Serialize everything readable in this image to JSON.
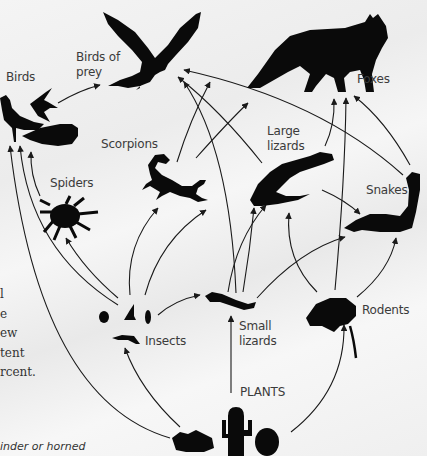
{
  "diagram": {
    "colors": {
      "silhouette": "#0a0a0a",
      "arrow": "#1a1a1a",
      "label": "#3b3b3b"
    },
    "nodes": [
      {
        "id": "birds",
        "label": "Birds"
      },
      {
        "id": "birds_of_prey",
        "label": "Birds of prey",
        "lines": [
          "Birds of",
          "prey"
        ]
      },
      {
        "id": "foxes",
        "label": "Foxes"
      },
      {
        "id": "scorpions",
        "label": "Scorpions"
      },
      {
        "id": "large_lizards",
        "label": "Large lizards",
        "lines": [
          "Large",
          "lizards"
        ]
      },
      {
        "id": "spiders",
        "label": "Spiders"
      },
      {
        "id": "snakes",
        "label": "Snakes"
      },
      {
        "id": "insects",
        "label": "Insects"
      },
      {
        "id": "small_lizards",
        "label": "Small lizards",
        "lines": [
          "Small",
          "lizards"
        ]
      },
      {
        "id": "rodents",
        "label": "Rodents"
      },
      {
        "id": "plants",
        "label": "PLANTS"
      }
    ],
    "edges": [
      {
        "from": "birds",
        "to": "birds_of_prey"
      },
      {
        "from": "scorpions",
        "to": "birds_of_prey"
      },
      {
        "from": "snakes",
        "to": "birds_of_prey"
      },
      {
        "from": "large_lizards",
        "to": "birds_of_prey"
      },
      {
        "from": "small_lizards",
        "to": "birds_of_prey"
      },
      {
        "from": "scorpions",
        "to": "foxes"
      },
      {
        "from": "large_lizards",
        "to": "foxes"
      },
      {
        "from": "rodents",
        "to": "foxes"
      },
      {
        "from": "snakes",
        "to": "foxes"
      },
      {
        "from": "insects",
        "to": "birds"
      },
      {
        "from": "spiders",
        "to": "birds"
      },
      {
        "from": "plants",
        "to": "birds"
      },
      {
        "from": "insects",
        "to": "spiders"
      },
      {
        "from": "insects",
        "to": "scorpions"
      },
      {
        "from": "insects",
        "to": "large_lizards"
      },
      {
        "from": "insects",
        "to": "small_lizards"
      },
      {
        "from": "small_lizards",
        "to": "large_lizards"
      },
      {
        "from": "small_lizards",
        "to": "scorpions"
      },
      {
        "from": "small_lizards",
        "to": "snakes"
      },
      {
        "from": "large_lizards",
        "to": "snakes"
      },
      {
        "from": "rodents",
        "to": "snakes"
      },
      {
        "from": "rodents",
        "to": "large_lizards"
      },
      {
        "from": "plants",
        "to": "insects"
      },
      {
        "from": "plants",
        "to": "small_lizards"
      },
      {
        "from": "plants",
        "to": "rodents"
      }
    ]
  },
  "side_text": {
    "lines": [
      "l",
      "e",
      "ew",
      "tent",
      "rcent."
    ]
  },
  "caption": "inder or horned"
}
